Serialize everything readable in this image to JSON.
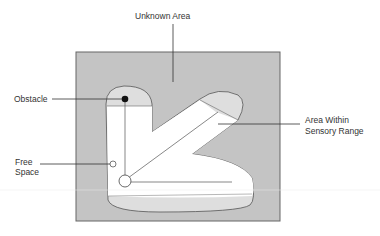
{
  "labels": {
    "unknown_area": "Unknown Area",
    "obstacle": "Obstacle",
    "free_space_line1": "Free",
    "free_space_line2": "Space",
    "sensory_line1": "Area Within",
    "sensory_line2": "Sensory Range"
  },
  "colors": {
    "unknown": "#c4c4c4",
    "sensory_edge": "#dedede",
    "free": "#ffffff",
    "stroke": "#555555",
    "obstacle": "#111111"
  }
}
